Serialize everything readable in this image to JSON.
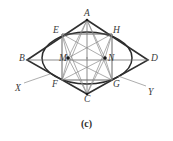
{
  "figure": {
    "caption": "(c)",
    "type": "four-center-approximate-ellipse-in-rhombus",
    "stroke_color": "#333333",
    "light_stroke_color": "#8c8c8c",
    "background": "#ffffff",
    "vertex_labels": [
      {
        "name": "A",
        "text": "A",
        "x": 84,
        "y": 9
      },
      {
        "name": "E",
        "text": "E",
        "x": 53,
        "y": 26
      },
      {
        "name": "H",
        "text": "H",
        "x": 113,
        "y": 26
      },
      {
        "name": "B",
        "text": "B",
        "x": 19,
        "y": 54
      },
      {
        "name": "M",
        "text": "M",
        "x": 59,
        "y": 54
      },
      {
        "name": "N",
        "text": "N",
        "x": 108,
        "y": 54
      },
      {
        "name": "D",
        "text": "D",
        "x": 151,
        "y": 54
      },
      {
        "name": "X",
        "text": "X",
        "x": 15,
        "y": 84
      },
      {
        "name": "F",
        "text": "F",
        "x": 52,
        "y": 80
      },
      {
        "name": "G",
        "text": "G",
        "x": 113,
        "y": 80
      },
      {
        "name": "Y",
        "text": "Y",
        "x": 148,
        "y": 88
      },
      {
        "name": "C",
        "text": "C",
        "x": 84,
        "y": 95
      }
    ],
    "geometry": {
      "rhombus": [
        {
          "point": "A",
          "x": 87,
          "y": 20
        },
        {
          "point": "D",
          "x": 148,
          "y": 60
        },
        {
          "point": "C",
          "x": 87,
          "y": 94
        },
        {
          "point": "B",
          "x": 27,
          "y": 60
        }
      ],
      "inner_rectangle": [
        {
          "point": "E",
          "x": 62,
          "y": 34
        },
        {
          "point": "H",
          "x": 112,
          "y": 34
        },
        {
          "point": "G",
          "x": 112,
          "y": 80
        },
        {
          "point": "F",
          "x": 62,
          "y": 80
        }
      ],
      "centers": [
        {
          "point": "M",
          "x": 68,
          "y": 58
        },
        {
          "point": "N",
          "x": 105,
          "y": 58
        }
      ],
      "ellipse": {
        "cx": 87,
        "cy": 58,
        "rx": 45,
        "ry": 26
      },
      "extension_lines": [
        {
          "from": "X",
          "to": "F"
        },
        {
          "from": "G",
          "to": "Y"
        }
      ]
    }
  }
}
